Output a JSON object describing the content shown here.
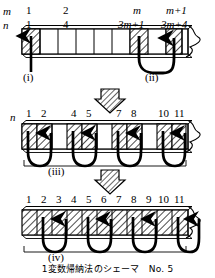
{
  "caption": "1変数帰納法のシェーマ　No. 5",
  "diagram1": {
    "row_label_m": "m",
    "row_label_n": "n",
    "columns": [
      {
        "m": "1",
        "n": "1"
      },
      {
        "m": "2",
        "n": "4"
      },
      {
        "m": "m",
        "n": "3m+1"
      },
      {
        "m": "m+1",
        "n": "3m+4"
      }
    ],
    "step_i": "(i)",
    "step_ii": "(ii)"
  },
  "diagram2": {
    "row_label_n": "n",
    "numbers": [
      "1",
      "2",
      "4",
      "5",
      "7",
      "8",
      "10",
      "11"
    ],
    "step_iii": "(iii)"
  },
  "diagram3": {
    "numbers": [
      "1",
      "2",
      "3",
      "4",
      "5",
      "6",
      "7",
      "8",
      "9",
      "10",
      "11"
    ],
    "step_iv": "(iv)"
  },
  "colors": {
    "ink": "#000000",
    "paper": "#ffffff",
    "hatch": "#000000",
    "shade": "#d8d8d8"
  }
}
